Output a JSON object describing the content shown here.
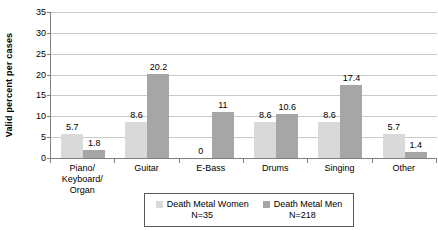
{
  "chart_data": {
    "type": "bar",
    "title": "",
    "xlabel": "",
    "ylabel": "Valid percent per cases",
    "ylim": [
      0,
      35
    ],
    "yticks": [
      0,
      5,
      10,
      15,
      20,
      25,
      30,
      35
    ],
    "grid": true,
    "legend_position": "bottom",
    "categories": [
      "Piano/Keyboard/Organ",
      "Guitar",
      "E-Bass",
      "Drums",
      "Singing",
      "Other"
    ],
    "category_label_lines": [
      [
        "Piano/",
        "Keyboard/",
        "Organ"
      ],
      [
        "Guitar"
      ],
      [
        "E-Bass"
      ],
      [
        "Drums"
      ],
      [
        "Singing"
      ],
      [
        "Other"
      ]
    ],
    "series": [
      {
        "name": "Death Metal Women",
        "n_label": "N=35",
        "color": "#d9d9d9",
        "values": [
          5.7,
          8.6,
          0,
          8.6,
          8.6,
          5.7
        ],
        "value_labels": [
          "5.7",
          "8.6",
          "0",
          "8.6",
          "8.6",
          "5.7"
        ]
      },
      {
        "name": "Death Metal Men",
        "n_label": "N=218",
        "color": "#a6a6a6",
        "values": [
          1.8,
          20.2,
          11,
          10.6,
          17.4,
          1.4
        ],
        "value_labels": [
          "1.8",
          "20.2",
          "11",
          "10.6",
          "17.4",
          "1.4"
        ]
      }
    ],
    "colors": {
      "gridline": "#c9c9c9",
      "axis": "#808080",
      "legend_border": "#595959",
      "text": "#000000"
    }
  }
}
